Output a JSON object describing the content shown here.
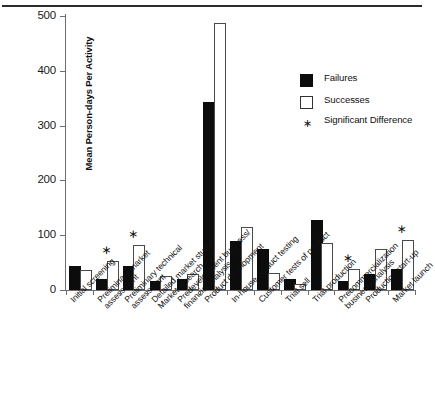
{
  "chart_data": {
    "type": "bar",
    "title": "",
    "subtitle": "",
    "xlabel": "",
    "ylabel": "Mean Person-days Per Activity",
    "ylim": [
      0,
      500
    ],
    "yticks": [
      0,
      100,
      200,
      300,
      400,
      500
    ],
    "ytick_labels": [
      "0",
      "100",
      "200",
      "300",
      "400",
      "500"
    ],
    "grid": false,
    "legend_position": "upper right",
    "categories": [
      "Initial screening",
      "Preliminary market assessment",
      "Preliminary technical assessment",
      "Detailed market study/ Market research",
      "Predevelopment business/ financial analysis",
      "Product development",
      "In-house product testing",
      "Customer tests of product",
      "Trial sell",
      "Trial production",
      "Precommercialization business analysis",
      "Production start-up",
      "Market launch"
    ],
    "category_lines": [
      [
        "Initial screening"
      ],
      [
        "Preliminary market",
        "assessment"
      ],
      [
        "Preliminary technical",
        "assessment"
      ],
      [
        "Detailed market study/",
        "Market research"
      ],
      [
        "Predevelopment business/",
        "financial analysis"
      ],
      [
        "Product development"
      ],
      [
        "In-house product testing"
      ],
      [
        "Customer tests of product"
      ],
      [
        "Trial sell"
      ],
      [
        "Trial production"
      ],
      [
        "Precommercialization",
        "business analysis"
      ],
      [
        "Production start-up"
      ],
      [
        "Market launch"
      ]
    ],
    "series": [
      {
        "name": "Failures",
        "color": "#0c0c0c",
        "values": [
          40,
          17,
          40,
          13,
          17,
          340,
          85,
          72,
          17,
          124,
          13,
          26,
          35
        ]
      },
      {
        "name": "Successes",
        "color": "#ffffff",
        "values": [
          32,
          50,
          78,
          22,
          25,
          483,
          112,
          27,
          8,
          82,
          35,
          72,
          88
        ]
      }
    ],
    "significant_difference": [
      false,
      true,
      true,
      false,
      false,
      false,
      false,
      false,
      false,
      false,
      true,
      false,
      true
    ],
    "annotations": {
      "star_symbol": "∗"
    }
  },
  "legend": {
    "items": [
      {
        "label": "Failures",
        "marker": "solid-square"
      },
      {
        "label": "Successes",
        "marker": "hollow-square"
      },
      {
        "label": "Significant Difference",
        "label_line1": "Significant",
        "label_line2": "Difference",
        "marker": "star"
      }
    ]
  }
}
